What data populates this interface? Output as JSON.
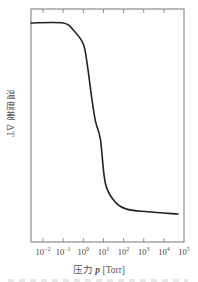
{
  "chart_data": {
    "type": "line",
    "title": "",
    "xlabel": "压力 p [Torr]",
    "ylabel": "温度差 ΔT",
    "xscale": "log",
    "xlim_exponent": [
      -2.6,
      5
    ],
    "ylim": [
      0,
      1
    ],
    "x_tick_labels": [
      "10^-2",
      "10^-1",
      "10^0",
      "10^1",
      "10^2",
      "10^3",
      "10^4",
      "10^5"
    ],
    "x_tick_exponents": [
      -2,
      -1,
      0,
      1,
      2,
      3,
      4,
      5
    ],
    "y_ticks": [],
    "grid": false,
    "legend": null,
    "series": [
      {
        "name": "ΔT vs p",
        "x_log10": [
          -2.6,
          -1.0,
          -0.5,
          0.0,
          0.2,
          0.4,
          0.6,
          0.85,
          1.1,
          1.6,
          2.2,
          3.2,
          4.7
        ],
        "values": [
          0.94,
          0.94,
          0.91,
          0.85,
          0.76,
          0.63,
          0.52,
          0.44,
          0.25,
          0.17,
          0.14,
          0.13,
          0.12
        ]
      }
    ],
    "frame": {
      "left": 31,
      "right": 184,
      "top": 9,
      "bottom": 242
    },
    "px_per_decade": 20.15,
    "x_at_exp_minus2": 43
  },
  "labels": {
    "ylabel": "温度差 ΔT",
    "xlabel_prefix": "压力 ",
    "xlabel_var": "p",
    "xlabel_unit": " [Torr]"
  },
  "ticks": [
    {
      "base": "10",
      "exp": "−2"
    },
    {
      "base": "10",
      "exp": "−1"
    },
    {
      "base": "10",
      "exp": "0"
    },
    {
      "base": "10",
      "exp": "1"
    },
    {
      "base": "10",
      "exp": "2"
    },
    {
      "base": "10",
      "exp": "3"
    },
    {
      "base": "10",
      "exp": "4"
    },
    {
      "base": "10",
      "exp": "5"
    }
  ],
  "colors": {
    "frame": "#777777",
    "curve": "#222222",
    "text": "#444444"
  }
}
